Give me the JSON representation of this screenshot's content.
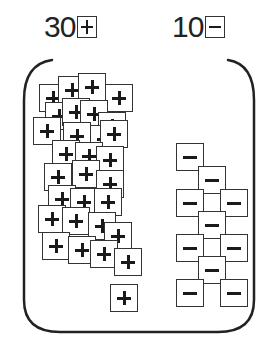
{
  "labels": {
    "positive": {
      "count": "30",
      "tile": "plus-tile"
    },
    "negative": {
      "count": "10",
      "tile": "minus-tile"
    }
  },
  "colors": {
    "stroke": "#333333",
    "glyph": "#1a1a1a",
    "background": "#ffffff"
  },
  "tiles": {
    "positive_count": 30,
    "negative_count": 10,
    "plus": [
      [
        39,
        84
      ],
      [
        58,
        76
      ],
      [
        78,
        73
      ],
      [
        105,
        84
      ],
      [
        45,
        102
      ],
      [
        62,
        98
      ],
      [
        80,
        100
      ],
      [
        98,
        112
      ],
      [
        33,
        117
      ],
      [
        63,
        122
      ],
      [
        90,
        125
      ],
      [
        100,
        120
      ],
      [
        52,
        140
      ],
      [
        75,
        142
      ],
      [
        96,
        146
      ],
      [
        44,
        163
      ],
      [
        72,
        160
      ],
      [
        96,
        170
      ],
      [
        48,
        185
      ],
      [
        70,
        188
      ],
      [
        94,
        188
      ],
      [
        38,
        205
      ],
      [
        62,
        207
      ],
      [
        88,
        212
      ],
      [
        104,
        222
      ],
      [
        42,
        232
      ],
      [
        68,
        236
      ],
      [
        90,
        240
      ],
      [
        114,
        248
      ],
      [
        110,
        284
      ]
    ],
    "minus": [
      [
        176,
        143
      ],
      [
        198,
        166
      ],
      [
        176,
        189
      ],
      [
        220,
        189
      ],
      [
        198,
        211
      ],
      [
        176,
        234
      ],
      [
        220,
        234
      ],
      [
        198,
        256
      ],
      [
        176,
        279
      ],
      [
        220,
        279
      ]
    ]
  }
}
